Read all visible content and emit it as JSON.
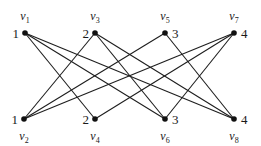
{
  "diagram": {
    "type": "bipartite-graph",
    "nodes": [
      {
        "id": "v1",
        "name": "v",
        "sub": "1",
        "weight": "1",
        "x": 25,
        "y": 33,
        "row": "top",
        "weight_side": "left"
      },
      {
        "id": "v3",
        "name": "v",
        "sub": "3",
        "weight": "2",
        "x": 95,
        "y": 33,
        "row": "top",
        "weight_side": "left"
      },
      {
        "id": "v5",
        "name": "v",
        "sub": "5",
        "weight": "3",
        "x": 165,
        "y": 33,
        "row": "top",
        "weight_side": "right"
      },
      {
        "id": "v7",
        "name": "v",
        "sub": "7",
        "weight": "4",
        "x": 234,
        "y": 33,
        "row": "top",
        "weight_side": "right"
      },
      {
        "id": "v2",
        "name": "v",
        "sub": "2",
        "weight": "1",
        "x": 24,
        "y": 119,
        "row": "bottom",
        "weight_side": "left"
      },
      {
        "id": "v4",
        "name": "v",
        "sub": "4",
        "weight": "2",
        "x": 95,
        "y": 119,
        "row": "bottom",
        "weight_side": "left"
      },
      {
        "id": "v6",
        "name": "v",
        "sub": "6",
        "weight": "3",
        "x": 165,
        "y": 119,
        "row": "bottom",
        "weight_side": "right"
      },
      {
        "id": "v8",
        "name": "v",
        "sub": "8",
        "weight": "4",
        "x": 234,
        "y": 119,
        "row": "bottom",
        "weight_side": "right"
      }
    ],
    "edges": [
      [
        "v1",
        "v4"
      ],
      [
        "v1",
        "v6"
      ],
      [
        "v1",
        "v8"
      ],
      [
        "v3",
        "v2"
      ],
      [
        "v3",
        "v6"
      ],
      [
        "v3",
        "v8"
      ],
      [
        "v5",
        "v2"
      ],
      [
        "v5",
        "v8"
      ],
      [
        "v7",
        "v2"
      ],
      [
        "v7",
        "v4"
      ],
      [
        "v7",
        "v6"
      ]
    ]
  }
}
